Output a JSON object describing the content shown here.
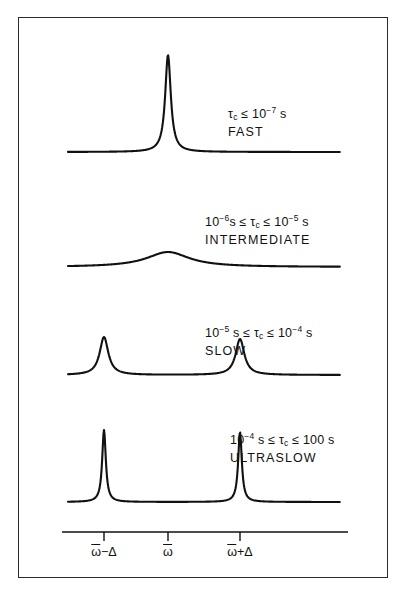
{
  "figure": {
    "border_color": "#2b2b2b",
    "trace_color": "#111111",
    "background": "#ffffff"
  },
  "traces": [
    {
      "id": "fast",
      "condition": "τc ≤ 10⁻⁷ s",
      "condition_parts": {
        "prefix": "",
        "tau": "τ",
        "tau_sub": "c",
        "rel1": "≤",
        "base1": "10",
        "exp1": "−7",
        "unit1": "s"
      },
      "regime": "FAST",
      "label_x": 228,
      "label_y": 104,
      "baseline_y": 152,
      "peaks": [
        {
          "center": "omega",
          "x": 168,
          "height": 97,
          "halfwidth": 3.4
        }
      ]
    },
    {
      "id": "intermediate",
      "condition": "10⁻⁶ s ≤ τc ≤ 10⁻⁵ s",
      "condition_parts": {
        "base0": "10",
        "exp0": "−6",
        "unit0": "s",
        "rel0": "≤",
        "tau": "τ",
        "tau_sub": "c",
        "rel1": "≤",
        "base1": "10",
        "exp1": "−5",
        "unit1": "s"
      },
      "regime": "INTERMEDIATE",
      "label_x": 205,
      "label_y": 212,
      "baseline_y": 267,
      "peaks": [
        {
          "center": "omega",
          "x": 168,
          "height": 15,
          "halfwidth": 26
        }
      ]
    },
    {
      "id": "slow",
      "condition": "10⁻⁵ s ≤ τc ≤ 10⁻⁴ s",
      "condition_parts": {
        "base0": "10",
        "exp0": "−5",
        "unit0": "s",
        "rel0": "≤",
        "tau": "τ",
        "tau_sub": "c",
        "rel1": "≤",
        "base1": "10",
        "exp1": "−4",
        "unit1": "s"
      },
      "regime": "SLOW",
      "label_x": 205,
      "label_y": 323,
      "baseline_y": 375,
      "peaks": [
        {
          "center": "omega-delta",
          "x": 104,
          "height": 38,
          "halfwidth": 5.2
        },
        {
          "center": "omega+delta",
          "x": 240,
          "height": 36,
          "halfwidth": 5.2
        }
      ]
    },
    {
      "id": "ultraslow",
      "condition": "10⁻⁴ s ≤ τc ≤ 100 s",
      "condition_parts": {
        "base0": "10",
        "exp0": "−4",
        "unit0": "s",
        "rel0": "≤",
        "tau": "τ",
        "tau_sub": "c",
        "rel1": "≤",
        "base1": "100",
        "exp1": "",
        "unit1": "s"
      },
      "regime": "ULTRASLOW",
      "label_x": 230,
      "label_y": 430,
      "baseline_y": 502,
      "peaks": [
        {
          "center": "omega-delta",
          "x": 104,
          "height": 72,
          "halfwidth": 2.2
        },
        {
          "center": "omega+delta",
          "x": 240,
          "height": 70,
          "halfwidth": 2.2
        }
      ]
    }
  ],
  "axis": {
    "line_y": 532,
    "x_start": 62,
    "x_end": 348,
    "tick_length": 9,
    "ticks": [
      {
        "id": "omega-minus-delta",
        "x": 104,
        "label_main": "ω",
        "label_suffix": "−Δ",
        "label": "ω̅−Δ"
      },
      {
        "id": "omega",
        "x": 168,
        "label_main": "ω",
        "label_suffix": "",
        "label": "ω̅"
      },
      {
        "id": "omega-plus-delta",
        "x": 240,
        "label_main": "ω",
        "label_suffix": "+Δ",
        "label": "ω̅+Δ"
      }
    ],
    "label_y": 545
  },
  "chart_data": {
    "type": "line",
    "xlabel": "",
    "ylabel": "",
    "grid": false,
    "legend": "none",
    "x_tick_labels": [
      "ω̅−Δ",
      "ω̅",
      "ω̅+Δ"
    ],
    "series": [
      {
        "name": "FAST",
        "annotation": "τc ≤ 10⁻⁷ s",
        "peaks_at": [
          "ω̅"
        ],
        "relative_heights": [
          1.0
        ],
        "relative_widths": [
          0.05
        ],
        "description": "single narrow motionally-averaged line"
      },
      {
        "name": "INTERMEDIATE",
        "annotation": "10⁻⁶ s ≤ τc ≤ 10⁻⁵ s",
        "peaks_at": [
          "ω̅"
        ],
        "relative_heights": [
          0.15
        ],
        "relative_widths": [
          0.4
        ],
        "description": "single broad coalesced hump"
      },
      {
        "name": "SLOW",
        "annotation": "10⁻⁵ s ≤ τc ≤ 10⁻⁴ s",
        "peaks_at": [
          "ω̅−Δ",
          "ω̅+Δ"
        ],
        "relative_heights": [
          0.39,
          0.37
        ],
        "relative_widths": [
          0.08,
          0.08
        ],
        "description": "resolved doublet, moderately broad"
      },
      {
        "name": "ULTRASLOW",
        "annotation": "10⁻⁴ s ≤ τc ≤ 100 s",
        "peaks_at": [
          "ω̅−Δ",
          "ω̅+Δ"
        ],
        "relative_heights": [
          0.74,
          0.72
        ],
        "relative_widths": [
          0.03,
          0.03
        ],
        "description": "sharp resolved doublet at rigid-limit splitting"
      }
    ]
  }
}
